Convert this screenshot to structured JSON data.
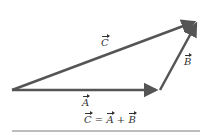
{
  "diagram": {
    "vectors": [
      {
        "name": "A",
        "label": "A",
        "from": [
          12,
          90
        ],
        "to": [
          160,
          90
        ]
      },
      {
        "name": "B",
        "label": "B",
        "from": [
          160,
          90
        ],
        "to": [
          198,
          20
        ]
      },
      {
        "name": "C",
        "label": "C",
        "from": [
          12,
          90
        ],
        "to": [
          198,
          20
        ]
      }
    ],
    "equation": {
      "lhs": "C",
      "eq": " = ",
      "a": "A",
      "plus": " + ",
      "b": "B"
    },
    "colors": {
      "arrow": "#555555",
      "text": "#333333",
      "rule": "#bdbdbd"
    }
  }
}
